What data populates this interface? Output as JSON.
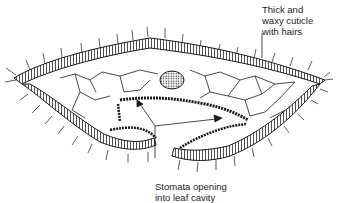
{
  "figure": {
    "labels": {
      "cuticle": [
        "Thick and",
        "waxy cuticle",
        "with hairs"
      ],
      "stomata": [
        "Stomata opening",
        "into leaf cavity"
      ]
    },
    "colors": {
      "line": "#1a1a1a",
      "background": "#ffffff",
      "text": "#222222"
    }
  }
}
